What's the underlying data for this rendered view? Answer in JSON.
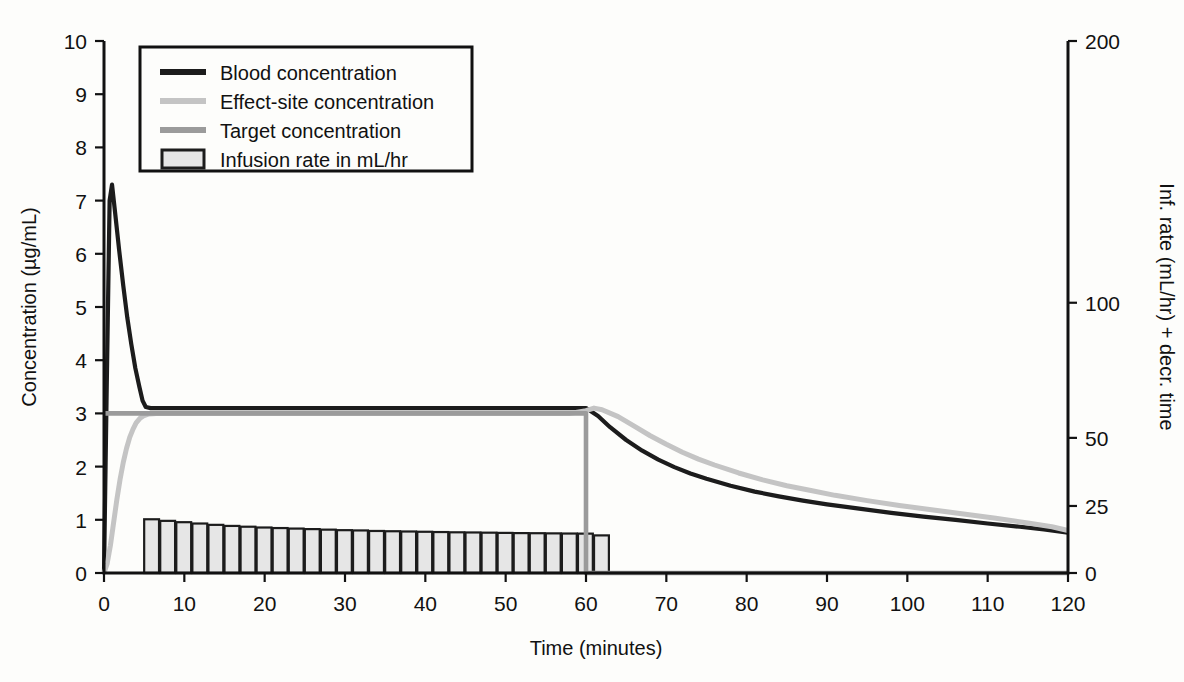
{
  "chart_data": {
    "type": "line",
    "title": "",
    "xlabel": "Time (minutes)",
    "ylabel": "Concentration (µg/mL)",
    "y2label": "Inf. rate (mL/hr) + decr. time",
    "xlim": [
      0,
      120
    ],
    "ylim": [
      0,
      10
    ],
    "y2lim": [
      0,
      200
    ],
    "grid": false,
    "xticks": [
      0,
      10,
      20,
      30,
      40,
      50,
      60,
      70,
      80,
      90,
      100,
      110,
      120
    ],
    "xticklabels": [
      "0",
      "10",
      "20",
      "30",
      "40",
      "50",
      "60",
      "70",
      "80",
      "90",
      "100",
      "110",
      "120"
    ],
    "yticks": [
      0,
      1,
      2,
      3,
      4,
      5,
      6,
      7,
      8,
      9,
      10
    ],
    "yticklabels": [
      "0",
      "1",
      "2",
      "3",
      "4",
      "5",
      "6",
      "7",
      "8",
      "9",
      "10"
    ],
    "y2ticks": [
      0,
      25,
      50,
      100,
      200
    ],
    "y2ticklabels": [
      "0",
      "25",
      "50",
      "100",
      "200"
    ],
    "y2_tick_fractions": [
      0.0,
      0.126,
      0.254,
      0.508,
      1.0
    ],
    "legend_position": "upper-left",
    "series": [
      {
        "name": "Blood concentration",
        "color": "#1c1c1c",
        "width": 4.2,
        "points": [
          [
            0.0,
            0.0
          ],
          [
            0.35,
            3.6
          ],
          [
            0.7,
            7.0
          ],
          [
            1.0,
            7.3
          ],
          [
            1.4,
            6.75
          ],
          [
            1.9,
            6.05
          ],
          [
            2.4,
            5.4
          ],
          [
            2.9,
            4.8
          ],
          [
            3.4,
            4.3
          ],
          [
            3.9,
            3.85
          ],
          [
            4.4,
            3.5
          ],
          [
            4.8,
            3.24
          ],
          [
            5.2,
            3.12
          ],
          [
            5.8,
            3.1
          ],
          [
            7.0,
            3.1
          ],
          [
            10.0,
            3.1
          ],
          [
            15.0,
            3.1
          ],
          [
            20.0,
            3.1
          ],
          [
            25.0,
            3.1
          ],
          [
            30.0,
            3.1
          ],
          [
            35.0,
            3.1
          ],
          [
            40.0,
            3.1
          ],
          [
            45.0,
            3.1
          ],
          [
            50.0,
            3.1
          ],
          [
            55.0,
            3.1
          ],
          [
            59.0,
            3.1
          ],
          [
            60.0,
            3.1
          ],
          [
            61.5,
            2.95
          ],
          [
            63.0,
            2.74
          ],
          [
            65.0,
            2.5
          ],
          [
            67.0,
            2.3
          ],
          [
            69.0,
            2.13
          ],
          [
            71.0,
            1.99
          ],
          [
            73.0,
            1.87
          ],
          [
            75.0,
            1.77
          ],
          [
            78.0,
            1.64
          ],
          [
            81.0,
            1.53
          ],
          [
            84.0,
            1.44
          ],
          [
            87.0,
            1.36
          ],
          [
            90.0,
            1.29
          ],
          [
            94.0,
            1.21
          ],
          [
            98.0,
            1.13
          ],
          [
            102.0,
            1.06
          ],
          [
            106.0,
            1.0
          ],
          [
            110.0,
            0.93
          ],
          [
            114.0,
            0.87
          ],
          [
            117.0,
            0.82
          ],
          [
            120.0,
            0.76
          ]
        ]
      },
      {
        "name": "Effect-site concentration",
        "color": "#c4c4c4",
        "width": 5.0,
        "points": [
          [
            0.0,
            0.0
          ],
          [
            0.4,
            0.18
          ],
          [
            0.8,
            0.52
          ],
          [
            1.2,
            0.95
          ],
          [
            1.6,
            1.38
          ],
          [
            2.0,
            1.76
          ],
          [
            2.4,
            2.08
          ],
          [
            2.8,
            2.34
          ],
          [
            3.2,
            2.55
          ],
          [
            3.6,
            2.7
          ],
          [
            4.0,
            2.82
          ],
          [
            4.5,
            2.91
          ],
          [
            5.0,
            2.96
          ],
          [
            5.6,
            2.99
          ],
          [
            6.5,
            3.0
          ],
          [
            8.0,
            3.0
          ],
          [
            12.0,
            3.0
          ],
          [
            20.0,
            3.0
          ],
          [
            30.0,
            3.0
          ],
          [
            40.0,
            3.0
          ],
          [
            50.0,
            3.0
          ],
          [
            58.0,
            3.0
          ],
          [
            60.0,
            3.05
          ],
          [
            61.0,
            3.1
          ],
          [
            62.0,
            3.07
          ],
          [
            64.0,
            2.94
          ],
          [
            66.0,
            2.76
          ],
          [
            68.0,
            2.58
          ],
          [
            70.0,
            2.42
          ],
          [
            72.0,
            2.27
          ],
          [
            74.0,
            2.14
          ],
          [
            76.0,
            2.03
          ],
          [
            79.0,
            1.88
          ],
          [
            82.0,
            1.75
          ],
          [
            85.0,
            1.64
          ],
          [
            88.0,
            1.55
          ],
          [
            91.0,
            1.46
          ],
          [
            95.0,
            1.36
          ],
          [
            99.0,
            1.27
          ],
          [
            103.0,
            1.19
          ],
          [
            107.0,
            1.11
          ],
          [
            111.0,
            1.03
          ],
          [
            115.0,
            0.94
          ],
          [
            118.0,
            0.87
          ],
          [
            120.0,
            0.8
          ]
        ]
      },
      {
        "name": "Target concentration",
        "color": "#9b9b9b",
        "width": 4.6,
        "points": [
          [
            0.0,
            3.0
          ],
          [
            10.0,
            3.0
          ],
          [
            20.0,
            3.0
          ],
          [
            30.0,
            3.0
          ],
          [
            40.0,
            3.0
          ],
          [
            50.0,
            3.0
          ],
          [
            59.5,
            3.0
          ],
          [
            60.0,
            3.0
          ],
          [
            60.0,
            0.0
          ],
          [
            70.0,
            0.0
          ],
          [
            80.0,
            0.0
          ],
          [
            90.0,
            0.0
          ],
          [
            100.0,
            0.0
          ],
          [
            110.0,
            0.0
          ],
          [
            120.0,
            0.0
          ]
        ]
      }
    ],
    "bars": {
      "name": "Infusion rate in mL/hr",
      "fill": "#e6e6e6",
      "stroke": "#1c1c1c",
      "unit": "mL/hr",
      "axis": "right",
      "start_time": 5,
      "end_time": 60,
      "bar_width_minutes": 1.85,
      "step_minutes": 2,
      "values_left_axis": [
        1.01,
        0.98,
        0.955,
        0.93,
        0.905,
        0.885,
        0.87,
        0.855,
        0.845,
        0.835,
        0.825,
        0.815,
        0.805,
        0.8,
        0.79,
        0.785,
        0.78,
        0.775,
        0.77,
        0.765,
        0.762,
        0.758,
        0.754,
        0.75,
        0.748,
        0.745,
        0.742,
        0.74,
        0.707
      ]
    }
  },
  "legend": {
    "entries": [
      {
        "label": "Blood concentration",
        "marker": "line",
        "color": "#1c1c1c"
      },
      {
        "label": "Effect-site concentration",
        "marker": "line",
        "color": "#c4c4c4"
      },
      {
        "label": "Target concentration",
        "marker": "line",
        "color": "#9b9b9b"
      },
      {
        "label": "Infusion rate in mL/hr",
        "marker": "swatch",
        "color": "#e6e6e6"
      }
    ]
  }
}
